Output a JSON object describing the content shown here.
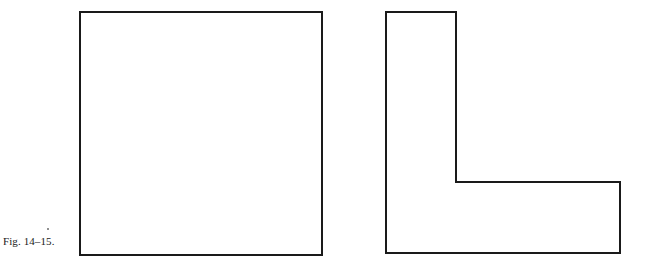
{
  "figure": {
    "caption": "Fig. 14–15.",
    "background_color": "#ffffff",
    "stroke_color": "#1a1a1a",
    "stroke_width": 2,
    "speck_color": "#6b6b6b",
    "shapes": [
      {
        "name": "square",
        "label": "square outline",
        "type": "polygon",
        "points": "80,12 322,12 322,255 80,255",
        "fill": "none"
      },
      {
        "name": "l-shape",
        "label": "L-shaped outline",
        "type": "polygon",
        "points": "386,12 456,12 456,182 620,182 620,253 386,253",
        "fill": "none"
      }
    ]
  },
  "canvas": {
    "width": 648,
    "height": 268
  }
}
